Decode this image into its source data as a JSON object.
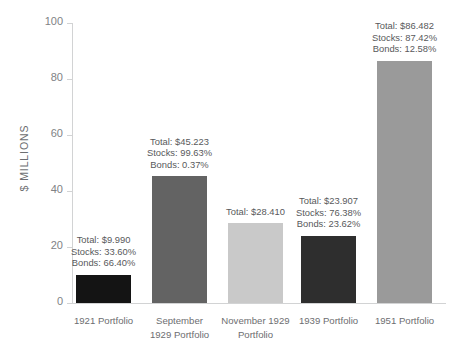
{
  "chart_data": {
    "type": "bar",
    "title": "",
    "xlabel": "",
    "ylabel": "$ MILLIONS",
    "ylim": [
      0,
      100
    ],
    "yticks": [
      "0",
      "20",
      "40",
      "60",
      "80",
      "100"
    ],
    "grid": false,
    "legend": "none",
    "categories": [
      "1921 Portfolio",
      "September 1929 Portfolio",
      "November 1929 Portfolio",
      "1939 Portfolio",
      "1951 Portfolio"
    ],
    "values": [
      9.99,
      45.223,
      28.41,
      23.907,
      86.482
    ],
    "colors": [
      "#141414",
      "#636363",
      "#c9c9c9",
      "#2e2e2e",
      "#9a9a9a"
    ],
    "bars": [
      {
        "category_line1": "1921 Portfolio",
        "category_line2": "",
        "value": 9.99,
        "color": "#141414",
        "annotation": {
          "total": "Total: $9.990",
          "stocks": "Stocks: 33.60%",
          "bonds": "Bonds: 66.40%"
        }
      },
      {
        "category_line1": "September",
        "category_line2": "1929 Portfolio",
        "value": 45.223,
        "color": "#636363",
        "annotation": {
          "total": "Total: $45.223",
          "stocks": "Stocks: 99.63%",
          "bonds": "Bonds: 0.37%"
        }
      },
      {
        "category_line1": "November 1929",
        "category_line2": "Portfolio",
        "value": 28.41,
        "color": "#c9c9c9",
        "annotation": {
          "total": "Total: $28.410",
          "stocks": "",
          "bonds": ""
        }
      },
      {
        "category_line1": "1939 Portfolio",
        "category_line2": "",
        "value": 23.907,
        "color": "#2e2e2e",
        "annotation": {
          "total": "Total: $23.907",
          "stocks": "Stocks: 76.38%",
          "bonds": "Bonds: 23.62%"
        }
      },
      {
        "category_line1": "1951 Portfolio",
        "category_line2": "",
        "value": 86.482,
        "color": "#9a9a9a",
        "annotation": {
          "total": "Total: $86.482",
          "stocks": "Stocks: 87.42%",
          "bonds": "Bonds: 12.58%"
        }
      }
    ]
  }
}
